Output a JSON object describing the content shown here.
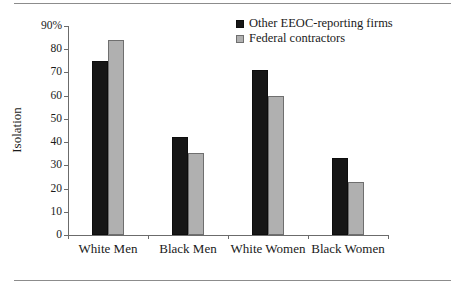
{
  "chart_data": {
    "type": "bar",
    "title": "",
    "xlabel": "",
    "ylabel": "Isolation",
    "ylim": [
      0,
      90
    ],
    "yticks": [
      0,
      10,
      20,
      30,
      40,
      50,
      60,
      70,
      80,
      90
    ],
    "ytick_labels": [
      "0",
      "10",
      "20",
      "30",
      "40",
      "50",
      "60",
      "70",
      "80",
      "90%"
    ],
    "grid": false,
    "legend_position": "top-right",
    "categories": [
      "White Men",
      "Black Men",
      "White Women",
      "Black Women"
    ],
    "series": [
      {
        "name": "Other EEOC-reporting firms",
        "color": "#161616",
        "values": [
          75,
          42,
          71,
          33
        ]
      },
      {
        "name": "Federal contractors",
        "color": "#b0b0b0",
        "values": [
          84,
          35.5,
          60,
          23
        ]
      }
    ]
  },
  "figure": {
    "rule_color": "#8c8c8c",
    "axis_color": "#6b6b6b"
  }
}
